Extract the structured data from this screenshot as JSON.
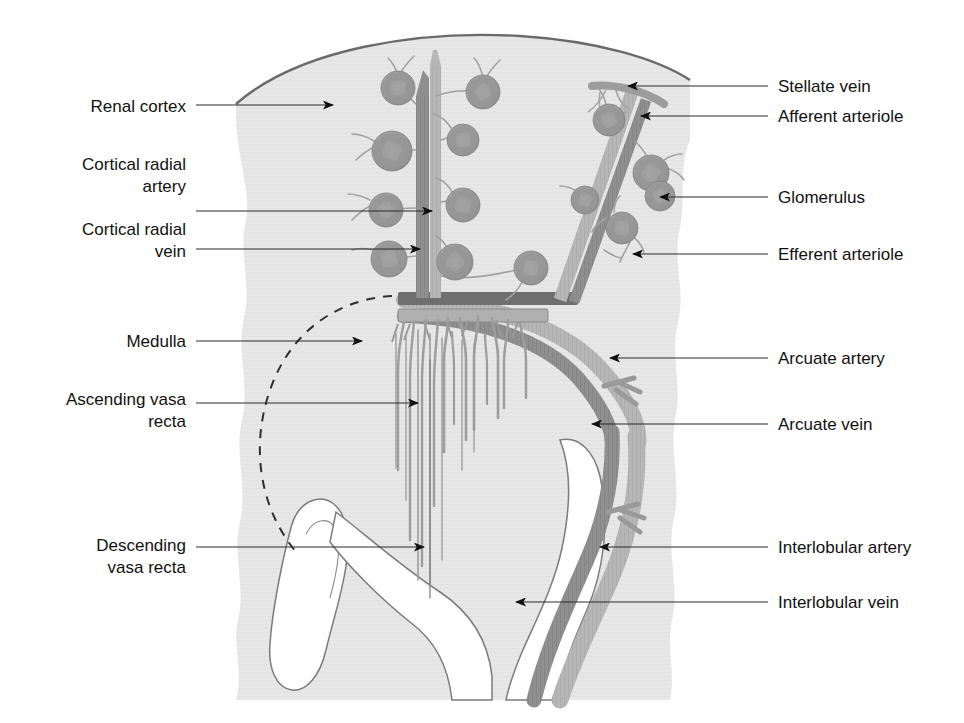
{
  "figure": {
    "background_color": "#ffffff",
    "parenchyma_color": "#e6e6e6",
    "capsule_color": "#6f6f6f",
    "artery_color": "#8d8d8d",
    "vein_color": "#b4b4b4",
    "glomerulus_color": "#9a9a9a",
    "label_color": "#111111",
    "leader_color": "#2a2a2a",
    "dashed_boundary_color": "#2f2f2f"
  },
  "labels_left": [
    {
      "id": "renal-cortex",
      "lines": [
        "Renal cortex"
      ],
      "x": 186,
      "y": 112,
      "align": "end",
      "leader_from_x": 196,
      "leader_y": 105,
      "leader_to_x": 333,
      "arrow": true
    },
    {
      "id": "cortical-radial-artery",
      "lines": [
        "Cortical radial",
        "artery"
      ],
      "x": 186,
      "y": 170,
      "align": "end",
      "leader_from_x": 196,
      "leader_y": 211,
      "leader_to_x": 432,
      "arrow": true
    },
    {
      "id": "cortical-radial-vein",
      "lines": [
        "Cortical radial",
        "vein"
      ],
      "x": 186,
      "y": 235,
      "align": "end",
      "leader_from_x": 196,
      "leader_y": 249,
      "leader_to_x": 420,
      "arrow": true
    },
    {
      "id": "medulla",
      "lines": [
        "Medulla"
      ],
      "x": 186,
      "y": 347,
      "align": "end",
      "leader_from_x": 196,
      "leader_y": 341,
      "leader_to_x": 362,
      "arrow": true
    },
    {
      "id": "ascending-vasa-recta",
      "lines": [
        "Ascending vasa",
        "recta"
      ],
      "x": 186,
      "y": 405,
      "align": "end",
      "leader_from_x": 196,
      "leader_y": 403,
      "leader_to_x": 418,
      "arrow": true
    },
    {
      "id": "descending-vasa-recta",
      "lines": [
        "Descending",
        "vasa recta"
      ],
      "x": 186,
      "y": 551,
      "align": "end",
      "leader_from_x": 196,
      "leader_y": 547,
      "leader_to_x": 424,
      "arrow": true
    }
  ],
  "labels_right": [
    {
      "id": "stellate-vein",
      "lines": [
        "Stellate vein"
      ],
      "x": 778,
      "y": 92,
      "align": "start",
      "leader_from_x": 768,
      "leader_y": 86,
      "leader_to_x": 628,
      "arrow": true
    },
    {
      "id": "afferent-arteriole",
      "lines": [
        "Afferent arteriole"
      ],
      "x": 778,
      "y": 122,
      "align": "start",
      "leader_from_x": 768,
      "leader_y": 116,
      "leader_to_x": 641,
      "arrow": true
    },
    {
      "id": "glomerulus",
      "lines": [
        "Glomerulus"
      ],
      "x": 778,
      "y": 203,
      "align": "start",
      "leader_from_x": 768,
      "leader_y": 197,
      "leader_to_x": 660,
      "arrow": true
    },
    {
      "id": "efferent-arteriole",
      "lines": [
        "Efferent arteriole"
      ],
      "x": 778,
      "y": 260,
      "align": "start",
      "leader_from_x": 768,
      "leader_y": 254,
      "leader_to_x": 633,
      "arrow": true
    },
    {
      "id": "arcuate-artery",
      "lines": [
        "Arcuate artery"
      ],
      "x": 778,
      "y": 364,
      "align": "start",
      "leader_from_x": 768,
      "leader_y": 358,
      "leader_to_x": 610,
      "arrow": true
    },
    {
      "id": "arcuate-vein",
      "lines": [
        "Arcuate vein"
      ],
      "x": 778,
      "y": 430,
      "align": "start",
      "leader_from_x": 768,
      "leader_y": 424,
      "leader_to_x": 592,
      "arrow": true
    },
    {
      "id": "interlobular-artery",
      "lines": [
        "Interlobular artery"
      ],
      "x": 778,
      "y": 553,
      "align": "start",
      "leader_from_x": 768,
      "leader_y": 547,
      "leader_to_x": 600,
      "arrow": true
    },
    {
      "id": "interlobular-vein",
      "lines": [
        "Interlobular vein"
      ],
      "x": 778,
      "y": 608,
      "align": "start",
      "leader_from_x": 768,
      "leader_y": 602,
      "leader_to_x": 516,
      "arrow": true
    }
  ],
  "glomeruli": [
    {
      "cx": 398,
      "cy": 88,
      "r": 17
    },
    {
      "cx": 483,
      "cy": 92,
      "r": 17
    },
    {
      "cx": 392,
      "cy": 151,
      "r": 20
    },
    {
      "cx": 463,
      "cy": 140,
      "r": 16
    },
    {
      "cx": 386,
      "cy": 210,
      "r": 17
    },
    {
      "cx": 463,
      "cy": 205,
      "r": 17
    },
    {
      "cx": 389,
      "cy": 259,
      "r": 18
    },
    {
      "cx": 455,
      "cy": 262,
      "r": 18
    },
    {
      "cx": 531,
      "cy": 268,
      "r": 17
    },
    {
      "cx": 609,
      "cy": 120,
      "r": 16
    },
    {
      "cx": 651,
      "cy": 173,
      "r": 18
    },
    {
      "cx": 622,
      "cy": 228,
      "r": 16
    },
    {
      "cx": 660,
      "cy": 196,
      "r": 15
    },
    {
      "cx": 585,
      "cy": 200,
      "r": 14
    }
  ],
  "vasa_recta_count": 13
}
